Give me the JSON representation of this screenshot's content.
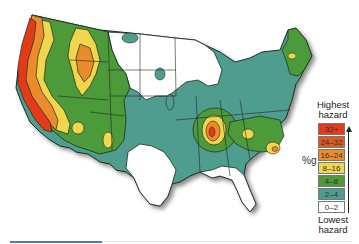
{
  "map": {
    "subject": "Seismic hazard map of the contiguous United States",
    "colors": {
      "c32plus": "#e33a1a",
      "c24_32": "#df5a20",
      "c16_24": "#eb8c2c",
      "c8_16": "#f0d64c",
      "c4_8": "#4c9a3a",
      "c2_4": "#4f9d8f",
      "c0_2": "#ffffff",
      "border": "#1e2a1e"
    }
  },
  "legend": {
    "top_label_line1": "Highest",
    "top_label_line2": "hazard",
    "unit_label": "%g",
    "bottom_label_line1": "Lowest",
    "bottom_label_line2": "hazard",
    "items": [
      {
        "label": "32+",
        "color": "#e33a1a"
      },
      {
        "label": "24–32",
        "color": "#df5a20"
      },
      {
        "label": "16–24",
        "color": "#eb8c2c"
      },
      {
        "label": "8–16",
        "color": "#f0d64c"
      },
      {
        "label": "4–8",
        "color": "#4c9a3a"
      },
      {
        "label": "2–4",
        "color": "#4f9d8f"
      },
      {
        "label": "0–2",
        "color": "#ffffff"
      }
    ]
  }
}
